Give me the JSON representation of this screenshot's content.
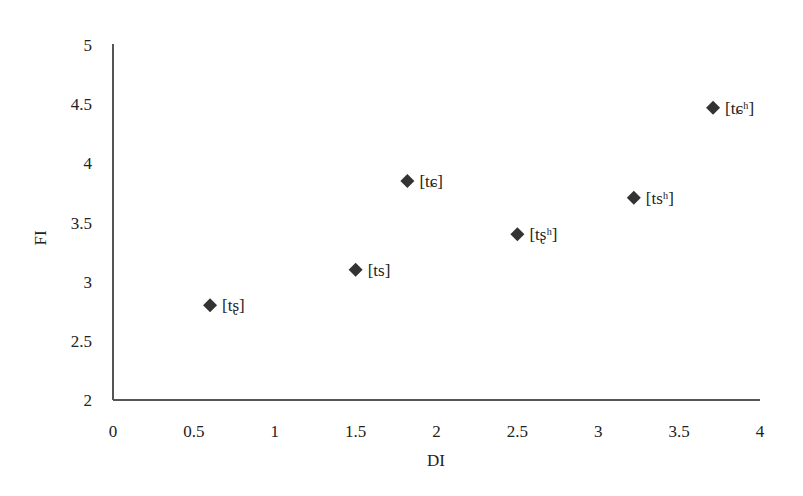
{
  "chart_data": {
    "type": "scatter",
    "title": "",
    "xlabel": "DI",
    "ylabel": "FI",
    "xlim": [
      0,
      4
    ],
    "ylim": [
      2,
      5
    ],
    "xticks": [
      "0",
      "0.5",
      "1",
      "1.5",
      "2",
      "2.5",
      "3",
      "3.5",
      "4"
    ],
    "yticks": [
      "2",
      "2.5",
      "3",
      "3.5",
      "4",
      "4.5",
      "5"
    ],
    "grid": false,
    "legend": null,
    "marker": "diamond",
    "marker_color": "#333333",
    "points": [
      {
        "label": "[tʂ]",
        "x": 0.6,
        "y": 2.8
      },
      {
        "label": "[ts]",
        "x": 1.5,
        "y": 3.1
      },
      {
        "label": "[tɕ]",
        "x": 1.82,
        "y": 3.85
      },
      {
        "label": "[tʂʰ]",
        "x": 2.5,
        "y": 3.4
      },
      {
        "label": "[tsʰ]",
        "x": 3.22,
        "y": 3.71
      },
      {
        "label": "[tɕʰ]",
        "x": 3.71,
        "y": 4.47
      }
    ]
  }
}
